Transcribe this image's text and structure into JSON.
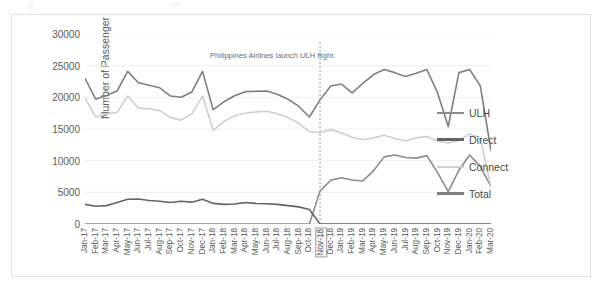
{
  "chart_data": {
    "type": "line",
    "title": "",
    "xlabel": "",
    "ylabel": "Number of Passenger",
    "ylim": [
      0,
      30000
    ],
    "ytick_values": [
      0,
      5000,
      10000,
      15000,
      20000,
      25000,
      30000
    ],
    "ytick_labels": [
      "0",
      "5000",
      "10000",
      "15000",
      "20000",
      "25000",
      "30000"
    ],
    "grid": true,
    "legend_position": "right",
    "annotations": [
      {
        "text": "Philippines Airlines launch ULH flight.",
        "x_category": "Nov-18",
        "type": "vertical-dashed-line-with-label"
      }
    ],
    "highlighted_category": "Nov-18",
    "categories": [
      "Jan-17",
      "Feb-17",
      "Mar-17",
      "Apr-17",
      "May-17",
      "Jun-17",
      "Jul-17",
      "Aug-17",
      "Sep-17",
      "Oct-17",
      "Nov-17",
      "Dec-17",
      "Jan-18",
      "Feb-18",
      "Mar-18",
      "Apr-18",
      "May-18",
      "Jun-18",
      "Jul-18",
      "Aug-18",
      "Sep-18",
      "Oct-18",
      "Nov-18",
      "Dec-18",
      "Jan-19",
      "Feb-19",
      "Mar-19",
      "Apr-19",
      "May-19",
      "Jun-19",
      "Jul-19",
      "Aug-19",
      "Sep-19",
      "Oct-19",
      "Nov-19",
      "Dec-19",
      "Jan-20",
      "Feb-20",
      "Mar-20"
    ],
    "series": [
      {
        "name": "ULH",
        "color": "#8c8c8c",
        "values": [
          0,
          0,
          0,
          0,
          0,
          0,
          0,
          0,
          0,
          0,
          0,
          0,
          0,
          0,
          0,
          0,
          0,
          0,
          0,
          0,
          0,
          0,
          5200,
          6900,
          7300,
          6950,
          6800,
          8400,
          10600,
          10900,
          10500,
          10400,
          10800,
          8100,
          5100,
          8500,
          10900,
          9100,
          5900
        ]
      },
      {
        "name": "Direct",
        "color": "#636363",
        "values": [
          3100,
          2800,
          2900,
          3400,
          3900,
          3950,
          3700,
          3600,
          3400,
          3600,
          3450,
          3900,
          3250,
          3100,
          3150,
          3400,
          3250,
          3200,
          3100,
          2900,
          2700,
          2300,
          0,
          0,
          0,
          0,
          0,
          0,
          0,
          0,
          0,
          0,
          0,
          0,
          0,
          0,
          0,
          0,
          0
        ]
      },
      {
        "name": "Connect",
        "color": "#cfcfcf",
        "values": [
          19900,
          16900,
          17400,
          17600,
          20200,
          18300,
          18200,
          17900,
          16800,
          16400,
          17400,
          20200,
          14800,
          16200,
          17100,
          17500,
          17700,
          17800,
          17400,
          16800,
          15900,
          14600,
          14400,
          14900,
          14400,
          13700,
          13300,
          13600,
          14000,
          13500,
          13100,
          13600,
          13800,
          13100,
          12800,
          13200,
          14200,
          13600,
          5700
        ]
      },
      {
        "name": "Total",
        "color": "#7f7f7f",
        "values": [
          23000,
          19700,
          20300,
          21000,
          24100,
          22300,
          21900,
          21500,
          20200,
          20000,
          20850,
          24100,
          18050,
          19300,
          20250,
          20900,
          20950,
          21000,
          20500,
          19700,
          18600,
          16900,
          19600,
          21800,
          22100,
          20700,
          22200,
          23600,
          24400,
          23900,
          23300,
          23800,
          24400,
          20700,
          15400,
          23900,
          24400,
          21800,
          11600
        ]
      }
    ]
  },
  "legend": {
    "items": [
      {
        "label": "ULH",
        "color": "#8c8c8c",
        "width": 2
      },
      {
        "label": "Direct",
        "color": "#636363",
        "width": 3
      },
      {
        "label": "Connect",
        "color": "#cfcfcf",
        "width": 2
      },
      {
        "label": "Total",
        "color": "#7f7f7f",
        "width": 3
      }
    ]
  }
}
